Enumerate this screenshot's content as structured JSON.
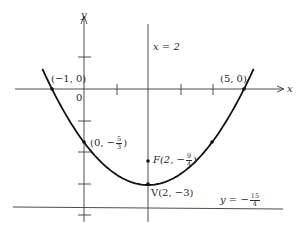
{
  "figure": {
    "type": "parabola-graph",
    "equation_form": "y = (1/3)(x - 2)^2 - 3",
    "axes": {
      "x_label": "x",
      "y_label": "y",
      "origin_label": "0"
    },
    "labels": {
      "axis_of_symmetry": "x = 2",
      "x_intercept_left": "(−1, 0)",
      "x_intercept_right": "(5, 0)",
      "y_intercept_prefix": "(0, −",
      "y_intercept_num": "5",
      "y_intercept_den": "3",
      "y_intercept_suffix": ")",
      "focus_prefix": "F(2, −",
      "focus_num": "9",
      "focus_den": "4",
      "focus_suffix": ")",
      "vertex": "V(2, −3)",
      "directrix_prefix": "y = −",
      "directrix_num": "15",
      "directrix_den": "4"
    },
    "points": [
      {
        "name": "x-intercept-left",
        "x": -1,
        "y": 0
      },
      {
        "name": "x-intercept-right",
        "x": 5,
        "y": 0
      },
      {
        "name": "y-intercept",
        "x": 0,
        "y": -1.6667
      },
      {
        "name": "symmetric-point",
        "x": 4,
        "y": -1.6667
      },
      {
        "name": "focus",
        "x": 2,
        "y": -2.25
      },
      {
        "name": "vertex",
        "x": 2,
        "y": -3
      }
    ],
    "lines": {
      "axis_of_symmetry_x": 2,
      "directrix_y": -3.75
    },
    "x_ticks": [
      1,
      2,
      3,
      4
    ],
    "y_ticks": [
      1,
      -1,
      -2,
      -3,
      -4
    ],
    "colors": {
      "ink": "#2a2a2a",
      "curve": "#111111",
      "background": "#ffffff"
    }
  }
}
